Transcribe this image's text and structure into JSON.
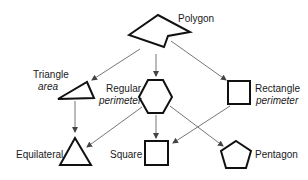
{
  "diagram": {
    "type": "class-hierarchy",
    "colors": {
      "shape_stroke": "#111111",
      "arrow": "#666666",
      "text": "#1a1a1a",
      "background": "#ffffff"
    },
    "nodes": {
      "polygon": {
        "label": "Polygon",
        "attribute": "",
        "shape": "irregular-polygon"
      },
      "triangle": {
        "label": "Triangle",
        "attribute": "area",
        "shape": "triangle"
      },
      "regular": {
        "label": "Regular",
        "attribute": "perimeter",
        "shape": "hexagon"
      },
      "rectangle": {
        "label": "Rectangle",
        "attribute": "perimeter",
        "shape": "rectangle"
      },
      "equilateral": {
        "label": "Equilateral",
        "attribute": "",
        "shape": "equilateral-triangle"
      },
      "square": {
        "label": "Square",
        "attribute": "",
        "shape": "square"
      },
      "pentagon": {
        "label": "Pentagon",
        "attribute": "",
        "shape": "pentagon"
      }
    },
    "edges": [
      {
        "from": "polygon",
        "to": "triangle"
      },
      {
        "from": "polygon",
        "to": "regular"
      },
      {
        "from": "polygon",
        "to": "rectangle"
      },
      {
        "from": "triangle",
        "to": "equilateral"
      },
      {
        "from": "regular",
        "to": "equilateral"
      },
      {
        "from": "regular",
        "to": "square"
      },
      {
        "from": "regular",
        "to": "pentagon"
      },
      {
        "from": "rectangle",
        "to": "square"
      }
    ]
  }
}
